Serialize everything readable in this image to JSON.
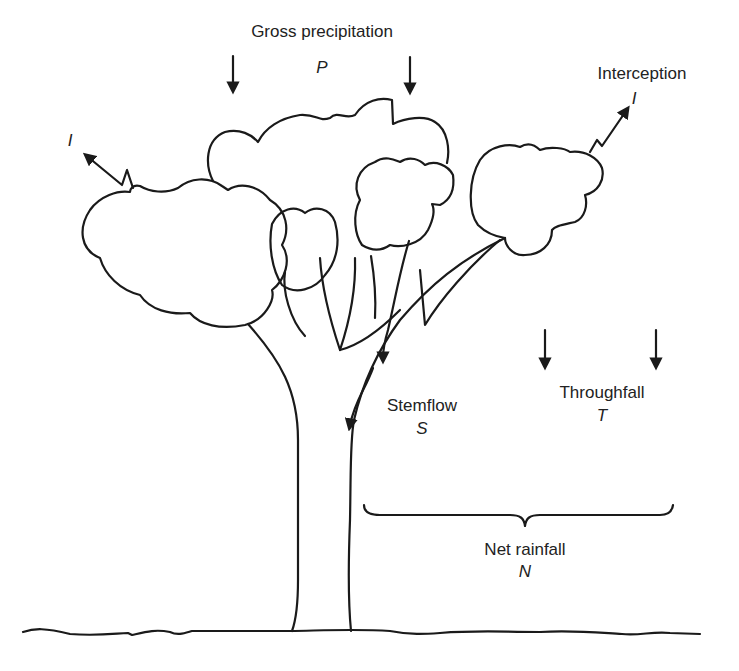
{
  "diagram": {
    "labels": {
      "gross_precipitation": {
        "text": "Gross precipitation",
        "symbol": "P"
      },
      "interception": {
        "text": "Interception",
        "symbol": "I"
      },
      "interception_left_symbol": "I",
      "stemflow": {
        "text": "Stemflow",
        "symbol": "S"
      },
      "throughfall": {
        "text": "Throughfall",
        "symbol": "T"
      },
      "net_rainfall": {
        "text": "Net rainfall",
        "symbol": "N"
      }
    },
    "elements": [
      {
        "id": "gross-precipitation-arrows",
        "type": "down-arrows",
        "count": 2
      },
      {
        "id": "interception-arrows",
        "type": "zigzag-up-arrows",
        "count": 2
      },
      {
        "id": "stemflow-arrows",
        "type": "trunk-flow-arrows",
        "count": 2
      },
      {
        "id": "throughfall-arrows",
        "type": "down-arrows",
        "count": 2
      },
      {
        "id": "net-rainfall-brace",
        "type": "curly-brace"
      },
      {
        "id": "tree",
        "type": "outline-drawing"
      },
      {
        "id": "ground-line",
        "type": "wavy-line"
      }
    ],
    "colors": {
      "stroke": "#1a1a1a",
      "background": "#ffffff",
      "text": "#222222"
    }
  }
}
